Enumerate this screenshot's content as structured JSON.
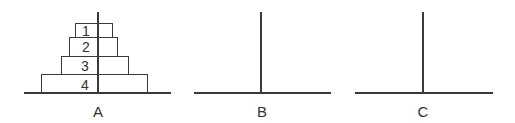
{
  "diagram": {
    "pegs": [
      {
        "label": "A",
        "disks": [
          "1",
          "2",
          "3",
          "4"
        ]
      },
      {
        "label": "B",
        "disks": []
      },
      {
        "label": "C",
        "disks": []
      }
    ]
  }
}
